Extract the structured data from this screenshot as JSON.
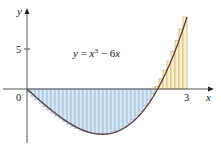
{
  "chart_data": {
    "type": "area",
    "title": "",
    "function": "y = x^3 - 6x",
    "equation_label": {
      "y": "y",
      "eq": " = ",
      "x": "x",
      "exp": "3",
      "rest": " − 6",
      "x2": "x"
    },
    "xlabel": "x",
    "ylabel": "y",
    "xlim": [
      0,
      3
    ],
    "ylim": [
      -5.66,
      9
    ],
    "x_ticks": [
      {
        "value": 0,
        "label": "0"
      },
      {
        "value": 3,
        "label": "3"
      }
    ],
    "y_ticks": [
      {
        "value": 5,
        "label": "5"
      }
    ],
    "grid": false,
    "legend": null,
    "riemann": {
      "n": 40,
      "a": 0,
      "b": 3,
      "method": "right-endpoint",
      "negative_fill": "#d6e6f4",
      "negative_stripe": "#9bb7d2",
      "positive_fill": "#fdf0c4",
      "positive_stripe": "#c9b58a"
    },
    "curve_points": [
      {
        "x": 0,
        "y": 0
      },
      {
        "x": 0.5,
        "y": -2.875
      },
      {
        "x": 1.0,
        "y": -5
      },
      {
        "x": 1.414,
        "y": -5.657
      },
      {
        "x": 2.0,
        "y": -4
      },
      {
        "x": 2.449,
        "y": 0
      },
      {
        "x": 2.75,
        "y": 4.3
      },
      {
        "x": 3.0,
        "y": 9
      }
    ],
    "colors": {
      "curve": "#5a3a3a",
      "axis": "#555555",
      "text": "#222222"
    }
  },
  "layout": {
    "origin_px": [
      27,
      89
    ],
    "px_per_x": 53.33,
    "px_per_y": 8,
    "y_axis_top": 8,
    "y_axis_bottom": 143,
    "x_axis_left": 3,
    "x_axis_right": 214
  }
}
